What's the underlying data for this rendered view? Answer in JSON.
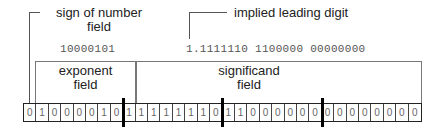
{
  "labels": {
    "sign": "sign of number\nfield",
    "sign_line1": "sign of number",
    "sign_line2": "field",
    "implied": "implied leading digit",
    "exponent_line1": "exponent",
    "exponent_line2": "field",
    "significand_line1": "significand",
    "significand_line2": "field"
  },
  "binary": {
    "exponent": "10000101",
    "significand": "1.1111110 1100000 00000000"
  },
  "bits": [
    "0",
    "1",
    "0",
    "0",
    "0",
    "0",
    "1",
    "0",
    "1",
    "1",
    "1",
    "1",
    "1",
    "1",
    "1",
    "0",
    "1",
    "1",
    "0",
    "0",
    "0",
    "0",
    "0",
    "0",
    "0",
    "0",
    "0",
    "0",
    "0",
    "0",
    "0",
    "0"
  ],
  "colors": {
    "line": "#555555",
    "divider": "#000000",
    "text": "#222222",
    "mono": "#555555"
  }
}
